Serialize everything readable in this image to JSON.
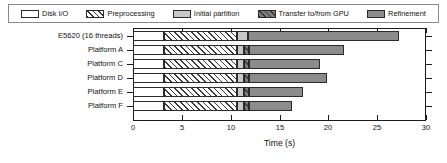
{
  "chart_data": {
    "type": "bar",
    "orientation": "horizontal",
    "stacked": true,
    "title": "",
    "xlabel": "Time (s)",
    "ylabel": "",
    "xlim": [
      0,
      30
    ],
    "xticks": [
      0,
      5,
      10,
      15,
      20,
      25,
      30
    ],
    "xtick_labels": [
      "0",
      "5",
      "10",
      "15",
      "20",
      "25",
      "30"
    ],
    "grid": false,
    "legend_position": "top",
    "categories": [
      "E5620 (16 threads)",
      "Platform A",
      "Platform C",
      "Platform D",
      "Platform E",
      "Platform F"
    ],
    "series": [
      {
        "name": "Disk I/O",
        "values": [
          3.2,
          3.2,
          3.2,
          3.2,
          3.2,
          3.2
        ]
      },
      {
        "name": "Preprocessing",
        "values": [
          7.4,
          7.4,
          7.4,
          7.4,
          7.4,
          7.4
        ]
      },
      {
        "name": "Initial partition",
        "values": [
          1.2,
          0.8,
          0.8,
          0.8,
          0.8,
          0.8
        ]
      },
      {
        "name": "Transfer to/from GPU",
        "values": [
          0.0,
          0.5,
          0.5,
          0.5,
          0.5,
          0.5
        ]
      },
      {
        "name": "Refinement",
        "values": [
          15.4,
          9.7,
          7.2,
          8.0,
          5.5,
          4.4
        ]
      }
    ],
    "totals": [
      27.2,
      21.6,
      19.1,
      19.9,
      17.4,
      16.3
    ],
    "segment_colors": [
      "#ffffff",
      "#ffffff",
      "#c8c8c8",
      "#7d7d7d",
      "#8c8c8c"
    ],
    "segment_patterns": [
      "solid",
      "diagonal-hatch",
      "solid",
      "diagonal-hatch",
      "solid"
    ]
  },
  "legend": {
    "items": [
      {
        "label": "Disk I/O",
        "color": "#ffffff",
        "pattern": "solid"
      },
      {
        "label": "Preprocessing",
        "color": "#ffffff",
        "pattern": "diagonal-hatch"
      },
      {
        "label": "Initial partition",
        "color": "#c8c8c8",
        "pattern": "solid"
      },
      {
        "label": "Transfer to/from GPU",
        "color": "#7d7d7d",
        "pattern": "diagonal-hatch"
      },
      {
        "label": "Refinement",
        "color": "#8c8c8c",
        "pattern": "solid"
      }
    ]
  }
}
